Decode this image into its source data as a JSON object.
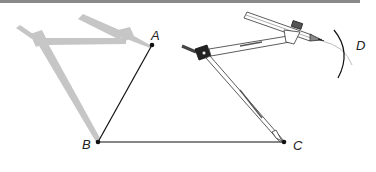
{
  "diagram": {
    "points": {
      "A": {
        "label": "A",
        "x": 152,
        "y": 45
      },
      "B": {
        "label": "B",
        "x": 98,
        "y": 142
      },
      "C": {
        "label": "C",
        "x": 284,
        "y": 142
      },
      "D": {
        "label": "D",
        "x": 320,
        "y": 47
      }
    },
    "segments": [
      {
        "from": "B",
        "to": "A"
      },
      {
        "from": "B",
        "to": "C"
      }
    ],
    "arc": {
      "label": "D"
    },
    "colors": {
      "line": "#111111",
      "ghost_compass": "#c4c4c4",
      "topbar": "#8a8a8a"
    }
  }
}
